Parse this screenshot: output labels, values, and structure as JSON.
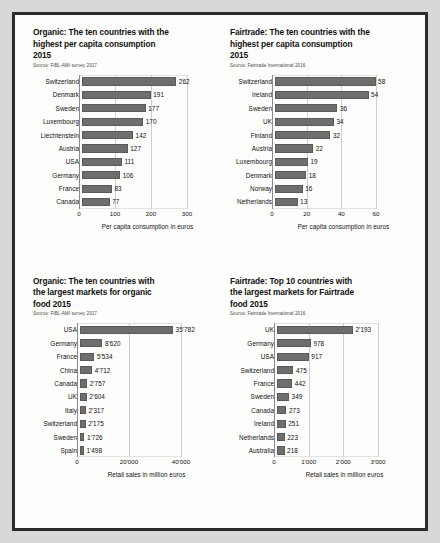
{
  "page": {
    "background_color": "#d8d8d6",
    "sheet_color": "#fdfdfc",
    "border_color": "#2b2b2b",
    "bar_color": "#6e6e6e"
  },
  "chart_data": [
    {
      "id": "organic-per-capita",
      "type": "bar",
      "orientation": "horizontal",
      "title": "Organic: The ten countries with the highest per capita consumption 2015",
      "title_lines": [
        "Organic: The ten countries with the",
        "highest per capita consumption",
        "2015"
      ],
      "source": "Source: FiBL-AMI survey 2017",
      "xlabel": "Per capita consumption in euros",
      "ylabel": "",
      "categories": [
        "Switzerland",
        "Denmark",
        "Sweden",
        "Luxembourg",
        "Liechtenstein",
        "Austria",
        "USA",
        "Germany",
        "France",
        "Canada"
      ],
      "values": [
        262,
        191,
        177,
        170,
        142,
        127,
        111,
        106,
        83,
        77
      ],
      "labels": [
        "262",
        "191",
        "177",
        "170",
        "142",
        "127",
        "111",
        "106",
        "83",
        "77"
      ],
      "xlim": [
        0,
        300
      ],
      "xticks": [
        0,
        100,
        200,
        300
      ],
      "xtick_labels": [
        "0",
        "100",
        "200",
        "300"
      ],
      "grid": true,
      "legend": "none"
    },
    {
      "id": "fairtrade-per-capita",
      "type": "bar",
      "orientation": "horizontal",
      "title": "Fairtrade: The ten countries with the highest per capita consumption 2015",
      "title_lines": [
        "Fairtrade: The ten countries with the",
        "highest per capita consumption",
        "2015"
      ],
      "source": "Source: Fairtrade International 2016",
      "xlabel": "Per capita consumption in euros",
      "ylabel": "",
      "categories": [
        "Switzerland",
        "Ireland",
        "Sweden",
        "UK",
        "Finland",
        "Austria",
        "Luxembourg",
        "Denmark",
        "Norway",
        "Netherlands"
      ],
      "values": [
        58,
        54,
        36,
        34,
        32,
        22,
        19,
        18,
        16,
        13
      ],
      "labels": [
        "58",
        "54",
        "36",
        "34",
        "32",
        "22",
        "19",
        "18",
        "16",
        "13"
      ],
      "xlim": [
        0,
        60
      ],
      "xticks": [
        0,
        20,
        40,
        60
      ],
      "xtick_labels": [
        "0",
        "20",
        "40",
        "60"
      ],
      "grid": true,
      "legend": "none"
    },
    {
      "id": "organic-markets",
      "type": "bar",
      "orientation": "horizontal",
      "title": "Organic: The ten countries with the largest markets for organic food 2015",
      "title_lines": [
        "Organic: The ten countries with",
        "the largest markets for organic",
        "food  2015"
      ],
      "source": "Source: FiBL-AMI survey 2017",
      "xlabel": "Retail sales in million euros",
      "ylabel": "",
      "categories": [
        "USA",
        "Germany",
        "France",
        "China",
        "Canada",
        "UK",
        "Italy",
        "Switzerland",
        "Sweden",
        "Spain"
      ],
      "values": [
        35782,
        8620,
        5534,
        4712,
        2757,
        2604,
        2317,
        2175,
        1726,
        1498
      ],
      "labels": [
        "35'782",
        "8'620",
        "5'534",
        "4'712",
        "2'757",
        "2'604",
        "2'317",
        "2'175",
        "1'726",
        "1'498"
      ],
      "xlim": [
        0,
        40000
      ],
      "xticks": [
        0,
        20000,
        40000
      ],
      "xtick_labels": [
        "0",
        "20'000",
        "40'000"
      ],
      "grid": true,
      "legend": "none"
    },
    {
      "id": "fairtrade-markets",
      "type": "bar",
      "orientation": "horizontal",
      "title": "Fairtrade: Top 10 countries with the largest markets for Fairtrade food 2015",
      "title_lines": [
        "Fairtrade: Top 10 countries with",
        "the largest markets for Fairtrade",
        "food 2015"
      ],
      "source": "Source: Fairtrade International 2016",
      "xlabel": "Retail sales in million euros",
      "ylabel": "",
      "categories": [
        "UK",
        "Germany",
        "USA",
        "Switzerland",
        "France",
        "Sweden",
        "Canada",
        "Ireland",
        "Netherlands",
        "Australia"
      ],
      "values": [
        2193,
        978,
        917,
        475,
        442,
        349,
        273,
        251,
        223,
        218
      ],
      "labels": [
        "2'193",
        "978",
        "917",
        "475",
        "442",
        "349",
        "273",
        "251",
        "223",
        "218"
      ],
      "xlim": [
        0,
        3000
      ],
      "xticks": [
        0,
        1000,
        2000,
        3000
      ],
      "xtick_labels": [
        "0",
        "1'000",
        "2'000",
        "3'000"
      ],
      "grid": true,
      "legend": "none"
    }
  ]
}
